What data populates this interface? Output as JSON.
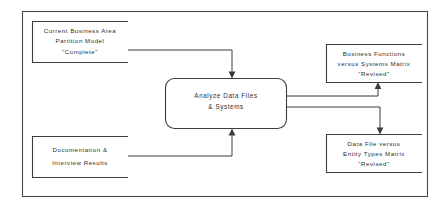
{
  "diagram": {
    "type": "data-flow-diagram",
    "frame": {
      "x": 22,
      "y": 11,
      "width": 405,
      "height": 185
    },
    "process": {
      "id": "analyze-data-files-systems",
      "shape": "rounded-rectangle",
      "lines": [
        "Analyze Data Files",
        "& Systems"
      ],
      "box": {
        "x": 165,
        "y": 78,
        "width": 122,
        "height": 51,
        "radius": 9
      }
    },
    "stores": [
      {
        "id": "current-business-area-partition-model",
        "role": "input",
        "open_side": "right",
        "lines": [
          "Current Business Area",
          "Partition Model",
          "\"Complete\""
        ],
        "box": {
          "x": 32,
          "y": 21,
          "width": 96,
          "height": 41
        }
      },
      {
        "id": "documentation-interview-results",
        "role": "input",
        "open_side": "right",
        "lines": [
          "Documentation &",
          "Interview Results"
        ],
        "box": {
          "x": 32,
          "y": 136,
          "width": 96,
          "height": 41
        }
      },
      {
        "id": "business-functions-versus-systems-matrix",
        "role": "output",
        "open_side": "right",
        "lines": [
          "Business Functions",
          "versus Systems Matrix",
          "\"Revised\""
        ],
        "box": {
          "x": 326,
          "y": 44,
          "width": 96,
          "height": 38
        }
      },
      {
        "id": "data-file-versus-entity-types-matrix",
        "role": "output",
        "open_side": "right",
        "lines": [
          "Data File versus",
          "Entity Types Matrix",
          "\"Revised\""
        ],
        "box": {
          "x": 326,
          "y": 134,
          "width": 96,
          "height": 38
        }
      }
    ],
    "flows": [
      {
        "id": "flow-partition-model-to-process",
        "from": "current-business-area-partition-model",
        "to": "analyze-data-files-systems",
        "direction": "down-into-top",
        "path": "M 128 50 L 232 50 L 232 73"
      },
      {
        "id": "flow-documentation-to-process",
        "from": "documentation-interview-results",
        "to": "analyze-data-files-systems",
        "direction": "up-into-bottom",
        "path": "M 128 156 L 232 156 L 232 134"
      },
      {
        "id": "flow-process-to-business-functions-matrix",
        "from": "analyze-data-files-systems",
        "to": "business-functions-versus-systems-matrix",
        "direction": "up-into-bottom",
        "path": "M 287 96 L 378 96 L 378 87"
      },
      {
        "id": "flow-process-to-data-file-matrix",
        "from": "analyze-data-files-systems",
        "to": "data-file-versus-entity-types-matrix",
        "direction": "down-into-top",
        "path": "M 287 107 L 380 107 L 380 129"
      }
    ],
    "colors": {
      "background": "#ffffff",
      "stroke": "#3c3c3c",
      "frame_stroke": "#4a4a4a",
      "text": "#2e2e2e"
    }
  }
}
